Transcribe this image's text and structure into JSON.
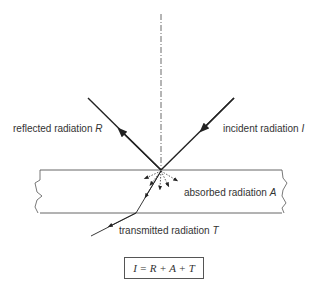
{
  "diagram": {
    "type": "radiation interaction with a medium",
    "labels": {
      "reflected": {
        "text": "reflected radiation ",
        "symbol": "R"
      },
      "incident": {
        "text": "incident radiation ",
        "symbol": "I"
      },
      "absorbed": {
        "text": "absorbed radiation ",
        "symbol": "A"
      },
      "transmitted": {
        "text": "transmitted radiation ",
        "symbol": "T"
      }
    },
    "equation": "I = R + A + T",
    "colors": {
      "line": "#222222",
      "slab_edge": "#555555",
      "text": "#333333"
    }
  }
}
